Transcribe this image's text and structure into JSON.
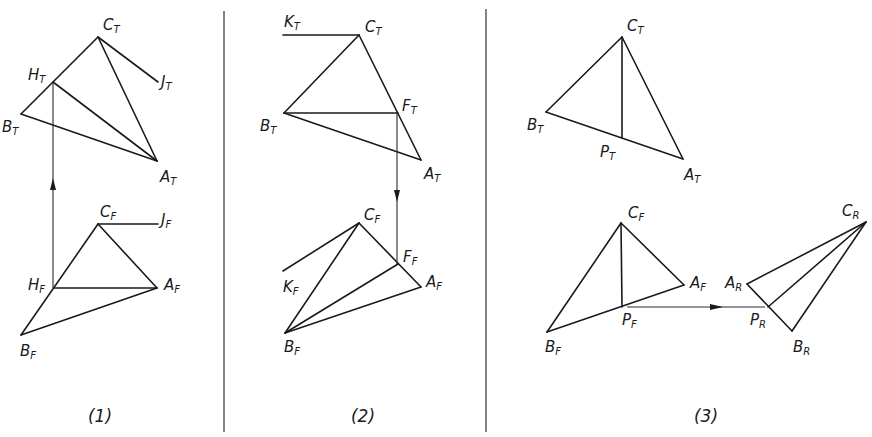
{
  "figure": {
    "colors": {
      "ink": "#1a1a1a",
      "background": "#ffffff"
    },
    "dividers": [
      {
        "x": 224,
        "y1": 11,
        "y2": 432
      },
      {
        "x": 486,
        "y1": 9,
        "y2": 432
      }
    ],
    "panels": [
      {
        "caption": "(1)",
        "caption_pos": [
          100,
          422
        ],
        "lines": [
          [
            [
              98,
              37
            ],
            [
              21,
              114
            ]
          ],
          [
            [
              98,
              37
            ],
            [
              157,
              161
            ]
          ],
          [
            [
              21,
              114
            ],
            [
              157,
              161
            ]
          ],
          [
            [
              53,
              82
            ],
            [
              157,
              161
            ]
          ],
          [
            [
              98,
              37
            ],
            [
              158,
              82
            ]
          ],
          [
            [
              98,
              224
            ],
            [
              21,
              335
            ]
          ],
          [
            [
              98,
              224
            ],
            [
              157,
              288
            ]
          ],
          [
            [
              21,
              335
            ],
            [
              157,
              288
            ]
          ],
          [
            [
              54,
              288
            ],
            [
              157,
              288
            ]
          ],
          [
            [
              98,
              224
            ],
            [
              158,
              224
            ]
          ]
        ],
        "arrows": [
          {
            "from": [
              53,
              288
            ],
            "to": [
              53,
              82
            ],
            "head": [
              53,
              184
            ],
            "dir": "up"
          }
        ],
        "labels": [
          {
            "main": "C",
            "sub": "T",
            "x": 103,
            "y": 30
          },
          {
            "main": "H",
            "sub": "T",
            "x": 28,
            "y": 80
          },
          {
            "main": "J",
            "sub": "T",
            "x": 161,
            "y": 87
          },
          {
            "main": "B",
            "sub": "T",
            "x": 2,
            "y": 132
          },
          {
            "main": "A",
            "sub": "T",
            "x": 160,
            "y": 182
          },
          {
            "main": "C",
            "sub": "F",
            "x": 100,
            "y": 217
          },
          {
            "main": "J",
            "sub": "F",
            "x": 161,
            "y": 225
          },
          {
            "main": "H",
            "sub": "F",
            "x": 28,
            "y": 290
          },
          {
            "main": "A",
            "sub": "F",
            "x": 164,
            "y": 290
          },
          {
            "main": "B",
            "sub": "F",
            "x": 20,
            "y": 356
          }
        ]
      },
      {
        "caption": "(2)",
        "caption_pos": [
          363,
          422
        ],
        "lines": [
          [
            [
              283,
              35
            ],
            [
              359,
              35
            ]
          ],
          [
            [
              359,
              35
            ],
            [
              284,
              113
            ]
          ],
          [
            [
              359,
              35
            ],
            [
              421,
              160
            ]
          ],
          [
            [
              284,
              113
            ],
            [
              421,
              160
            ]
          ],
          [
            [
              284,
              113
            ],
            [
              398,
              113
            ]
          ],
          [
            [
              359,
              223
            ],
            [
              283,
              271
            ]
          ],
          [
            [
              359,
              223
            ],
            [
              285,
              333
            ]
          ],
          [
            [
              359,
              223
            ],
            [
              421,
              287
            ]
          ],
          [
            [
              285,
              333
            ],
            [
              421,
              287
            ]
          ],
          [
            [
              285,
              333
            ],
            [
              398,
              264
            ]
          ]
        ],
        "arrows": [
          {
            "from": [
              397,
              113
            ],
            "to": [
              397,
              264
            ],
            "head": [
              397,
              196
            ],
            "dir": "down"
          }
        ],
        "labels": [
          {
            "main": "K",
            "sub": "T",
            "x": 284,
            "y": 27
          },
          {
            "main": "C",
            "sub": "T",
            "x": 365,
            "y": 32
          },
          {
            "main": "F",
            "sub": "T",
            "x": 402,
            "y": 111
          },
          {
            "main": "B",
            "sub": "T",
            "x": 260,
            "y": 131
          },
          {
            "main": "A",
            "sub": "T",
            "x": 424,
            "y": 179
          },
          {
            "main": "C",
            "sub": "F",
            "x": 364,
            "y": 220
          },
          {
            "main": "F",
            "sub": "F",
            "x": 403,
            "y": 262
          },
          {
            "main": "K",
            "sub": "F",
            "x": 283,
            "y": 292
          },
          {
            "main": "A",
            "sub": "F",
            "x": 426,
            "y": 287
          },
          {
            "main": "B",
            "sub": "F",
            "x": 284,
            "y": 352
          }
        ]
      },
      {
        "caption": "(3)",
        "caption_pos": [
          706,
          422
        ],
        "lines": [
          [
            [
              622,
              37
            ],
            [
              546,
              112
            ]
          ],
          [
            [
              622,
              37
            ],
            [
              683,
              159
            ]
          ],
          [
            [
              546,
              112
            ],
            [
              683,
              159
            ]
          ],
          [
            [
              622,
              37
            ],
            [
              622,
              138
            ]
          ],
          [
            [
              621,
              223
            ],
            [
              547,
              332
            ]
          ],
          [
            [
              621,
              223
            ],
            [
              684,
              285
            ]
          ],
          [
            [
              547,
              332
            ],
            [
              684,
              285
            ]
          ],
          [
            [
              621,
              223
            ],
            [
              622,
              307
            ]
          ],
          [
            [
              866,
              222
            ],
            [
              747,
              284
            ]
          ],
          [
            [
              866,
              222
            ],
            [
              768,
              307
            ]
          ],
          [
            [
              866,
              222
            ],
            [
              792,
              331
            ]
          ],
          [
            [
              747,
              284
            ],
            [
              792,
              331
            ]
          ]
        ],
        "arrows": [
          {
            "from": [
              627,
              307
            ],
            "to": [
              765,
              307
            ],
            "head": [
              716,
              307
            ],
            "dir": "right"
          }
        ],
        "labels": [
          {
            "main": "C",
            "sub": "T",
            "x": 627,
            "y": 31
          },
          {
            "main": "B",
            "sub": "T",
            "x": 527,
            "y": 130
          },
          {
            "main": "P",
            "sub": "T",
            "x": 600,
            "y": 157
          },
          {
            "main": "A",
            "sub": "T",
            "x": 684,
            "y": 180
          },
          {
            "main": "C",
            "sub": "F",
            "x": 628,
            "y": 218
          },
          {
            "main": "A",
            "sub": "F",
            "x": 690,
            "y": 288
          },
          {
            "main": "P",
            "sub": "F",
            "x": 622,
            "y": 325
          },
          {
            "main": "B",
            "sub": "F",
            "x": 545,
            "y": 352
          },
          {
            "main": "A",
            "sub": "R",
            "x": 725,
            "y": 288
          },
          {
            "main": "P",
            "sub": "R",
            "x": 750,
            "y": 325
          },
          {
            "main": "B",
            "sub": "R",
            "x": 793,
            "y": 352
          },
          {
            "main": "C",
            "sub": "R",
            "x": 842,
            "y": 216
          }
        ]
      }
    ]
  }
}
